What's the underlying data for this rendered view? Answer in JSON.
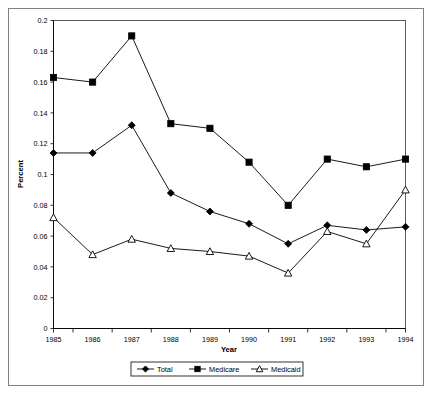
{
  "chart_data": {
    "type": "line",
    "title": "",
    "xlabel": "Year",
    "ylabel": "Percent",
    "categories": [
      "1985",
      "1986",
      "1987",
      "1988",
      "1989",
      "1990",
      "1991",
      "1992",
      "1993",
      "1994"
    ],
    "x": [
      1985,
      1986,
      1987,
      1988,
      1989,
      1990,
      1991,
      1992,
      1993,
      1994
    ],
    "xlim": [
      1985,
      1994
    ],
    "ylim": [
      0,
      0.2
    ],
    "ytick_labels": [
      "0",
      "0.02",
      "0.04",
      "0.06",
      "0.08",
      "0.1",
      "0.12",
      "0.14",
      "0.16",
      "0.18",
      "0.2"
    ],
    "ytick_values": [
      0,
      0.02,
      0.04,
      0.06,
      0.08,
      0.1,
      0.12,
      0.14,
      0.16,
      0.18,
      0.2
    ],
    "grid": false,
    "legend_position": "bottom",
    "series": [
      {
        "name": "Total",
        "marker": "diamond-filled",
        "color": "#000000",
        "values": [
          0.114,
          0.114,
          0.132,
          0.088,
          0.076,
          0.068,
          0.055,
          0.067,
          0.064,
          0.066
        ]
      },
      {
        "name": "Medicare",
        "marker": "square-filled",
        "color": "#000000",
        "values": [
          0.163,
          0.16,
          0.19,
          0.133,
          0.13,
          0.108,
          0.08,
          0.11,
          0.105,
          0.11
        ]
      },
      {
        "name": "Medicaid",
        "marker": "triangle-open",
        "color": "#000000",
        "values": [
          0.072,
          0.048,
          0.058,
          0.052,
          0.05,
          0.047,
          0.036,
          0.063,
          0.055,
          0.09
        ]
      }
    ]
  },
  "legend": {
    "items": [
      {
        "label": "Total"
      },
      {
        "label": "Medicare"
      },
      {
        "label": "Medicaid"
      }
    ]
  },
  "axes": {
    "x_title": "Year",
    "y_title": "Percent"
  }
}
